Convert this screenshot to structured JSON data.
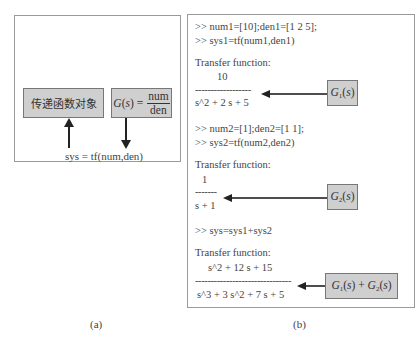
{
  "panel_a": {
    "left_box_label": "传递函数对象",
    "right_box": {
      "lhs": "G(s) =",
      "numerator": "num",
      "denominator": "den"
    },
    "command": "sys = tf(num,den)",
    "caption": "(a)"
  },
  "panel_b": {
    "block1": {
      "line1": ">> num1=[10];den1=[1 2 5];",
      "line2": ">> sys1=tf(num1,den1)",
      "header": "Transfer function:",
      "numerator": "10",
      "dashes": "------------------",
      "denominator": "s^2 + 2 s + 5",
      "label": "G1(s)"
    },
    "block2": {
      "line1": ">> num2=[1];den2=[1 1];",
      "line2": ">> sys2=tf(num2,den2)",
      "header": "Transfer function:",
      "numerator": "1",
      "dashes": "-------",
      "denominator": "s + 1",
      "label": "G2(s)"
    },
    "block3": {
      "line1": ">> sys=sys1+sys2",
      "header": "Transfer function:",
      "numerator": "s^2 + 12 s + 15",
      "dashes": "-------------------------------",
      "denominator": "s^3 + 3 s^2 + 7 s + 5",
      "label": "G1(s) + G2(s)"
    },
    "caption": "(b)"
  }
}
